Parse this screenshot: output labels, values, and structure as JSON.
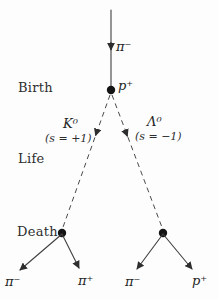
{
  "diagram": {
    "stages": {
      "birth": "Birth",
      "life": "Life",
      "death": "Death"
    },
    "particles": {
      "incoming_pion": "π⁻",
      "proton_target": "p⁺",
      "kaon": "K⁰",
      "kaon_strangeness": "(s = +1)",
      "lambda": "Λ⁰",
      "lambda_strangeness": "(s = −1)",
      "kaon_decay_pion_minus": "π⁻",
      "kaon_decay_pion_plus": "π⁺",
      "lambda_decay_pion_minus": "π⁻",
      "lambda_decay_proton": "p⁺"
    },
    "colors": {
      "background": "#fdfdfd",
      "line": "#3f3f3f",
      "arrow": "#2e2e2e",
      "vertex": "#141414",
      "text": "#2e2e2e"
    }
  }
}
